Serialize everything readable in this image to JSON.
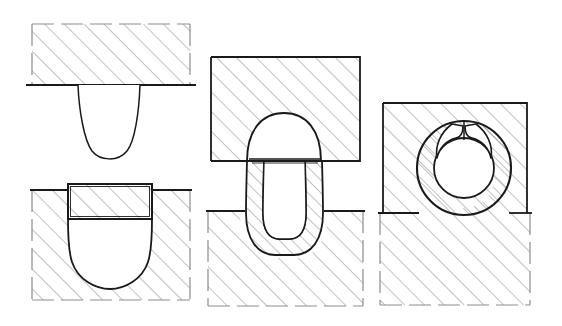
{
  "figure": {
    "title": "Cross-sectional stages of a sheet-metal curling / hemming forming sequence",
    "background_color": "#ffffff",
    "outline_color": "#1a1a1a",
    "hatch_color": "#8d8d8d",
    "cavity_fill": "#ffffff",
    "break_line_style": "dashed",
    "hatch_angle_deg": 45,
    "hatch_spacing_px": 14,
    "panel_count": 4
  },
  "panels": [
    {
      "id": "panel-stage-1",
      "name": "stage-1-punch-with-tapered-cavity",
      "caption": "",
      "position": "top-left",
      "elements": [
        {
          "name": "upper-tool-block",
          "kind": "hatched-block",
          "edges": "dashed-top-left-right-solid-bottom"
        },
        {
          "name": "tapered-u-cavity",
          "kind": "open-cavity",
          "fill": "white"
        },
        {
          "name": "parting-surface-line",
          "kind": "solid-line"
        }
      ]
    },
    {
      "id": "panel-stage-2",
      "name": "stage-2-punch-seated-in-die-with-dome-cavity",
      "caption": "",
      "position": "bottom-left",
      "elements": [
        {
          "name": "lower-die-block",
          "kind": "hatched-block",
          "edges": "dashed-left-right-bottom-solid-top"
        },
        {
          "name": "punch-insert-block",
          "kind": "hatched-block",
          "edges": "solid"
        },
        {
          "name": "dome-bottom-cavity",
          "kind": "closed-cavity",
          "fill": "white"
        },
        {
          "name": "parting-surface-line",
          "kind": "solid-line"
        }
      ]
    },
    {
      "id": "panel-stage-3",
      "name": "stage-3-formed-cup-between-upper-and-lower-tooling",
      "caption": "",
      "position": "center",
      "elements": [
        {
          "name": "upper-tool-block",
          "kind": "hatched-block",
          "edges": "solid"
        },
        {
          "name": "lower-die-block",
          "kind": "hatched-block",
          "edges": "dashed-left-right-bottom-solid-top"
        },
        {
          "name": "formed-workpiece-wall",
          "kind": "hatched-u-wall"
        },
        {
          "name": "workpiece-inner-cavity",
          "kind": "closed-cavity",
          "fill": "white"
        },
        {
          "name": "dome-head",
          "kind": "closed-cavity",
          "fill": "white"
        },
        {
          "name": "dome-shoulder-line",
          "kind": "solid-line"
        },
        {
          "name": "parting-surface-line",
          "kind": "solid-line"
        }
      ]
    },
    {
      "id": "panel-stage-4",
      "name": "stage-4-fully-curled-annular-section",
      "caption": "",
      "position": "right",
      "elements": [
        {
          "name": "upper-tool-block",
          "kind": "hatched-block",
          "edges": "solid"
        },
        {
          "name": "lower-die-block",
          "kind": "hatched-block",
          "edges": "dashed-left-right-bottom-solid-top"
        },
        {
          "name": "curled-ring-section",
          "kind": "hatched-annulus"
        },
        {
          "name": "ring-core-cavity",
          "kind": "closed-cavity",
          "fill": "white"
        },
        {
          "name": "curl-seam-notch",
          "kind": "seam-detail"
        },
        {
          "name": "parting-surface-line",
          "kind": "solid-line"
        }
      ]
    }
  ]
}
